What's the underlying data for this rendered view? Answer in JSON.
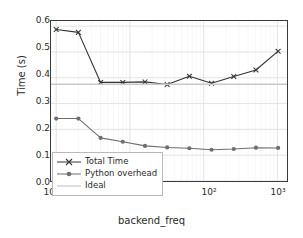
{
  "chart_data": {
    "type": "line",
    "title": "",
    "xlabel": "backend_freq",
    "ylabel": "Time (s)",
    "xscale": "log",
    "yscale": "linear",
    "xlim": [
      0.85,
      1350
    ],
    "ylim": [
      0.0,
      0.62
    ],
    "grid": true,
    "legend_position": "lower left",
    "x": [
      1,
      2,
      4,
      8,
      16,
      32,
      64,
      128,
      256,
      512,
      1024
    ],
    "xtick_labels": [
      "10⁰",
      "10¹",
      "10²",
      "10³"
    ],
    "xtick_values": [
      1,
      10,
      100,
      1000
    ],
    "ytick_labels": [
      "0.0",
      "0.1",
      "0.2",
      "0.3",
      "0.4",
      "0.5",
      "0.6"
    ],
    "ytick_values": [
      0.0,
      0.1,
      0.2,
      0.3,
      0.4,
      0.5,
      0.6
    ],
    "series": [
      {
        "name": "Total Time",
        "marker": "x",
        "color": "#333333",
        "values": [
          0.587,
          0.576,
          0.382,
          0.382,
          0.384,
          0.374,
          0.406,
          0.379,
          0.405,
          0.43,
          0.503
        ]
      },
      {
        "name": "Python overhead",
        "marker": "o",
        "color": "#6e6e6e",
        "values": [
          0.242,
          0.242,
          0.167,
          0.152,
          0.136,
          0.13,
          0.127,
          0.121,
          0.124,
          0.129,
          0.128
        ]
      },
      {
        "name": "Ideal",
        "marker": "none",
        "color": "#c9c9c9",
        "constant": 0.375
      }
    ]
  },
  "axes": {
    "ylabel_text": "Time (s)",
    "xlabel_text": "backend_freq"
  },
  "legend": {
    "items": [
      {
        "label": "Total Time"
      },
      {
        "label": "Python overhead"
      },
      {
        "label": "Ideal"
      }
    ]
  }
}
